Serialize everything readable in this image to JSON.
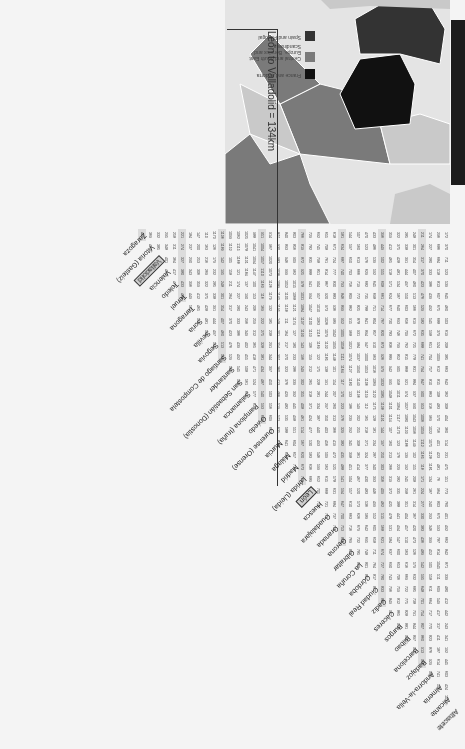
{
  "page": {
    "orientation": "rotated 180 degrees",
    "title": "León to Valladolid = 134km"
  },
  "map": {
    "legend": [
      {
        "label": "France and Andorra",
        "color": "#111111"
      },
      {
        "label": "Central and South East Europe, Benelux and Scandinavia",
        "color": "#7a7a7a"
      },
      {
        "label": "Spain and Portugal",
        "color": "#333333"
      }
    ],
    "colors": {
      "sea": "#e8e8e8",
      "other_land": "#c9c9c9",
      "border": "#ffffff"
    }
  },
  "table": {
    "cities": [
      "Albacete",
      "Alicante",
      "Almeria",
      "Andorra-la-Vella",
      "Badajoz",
      "Barcelona",
      "Bilbao",
      "Burgos",
      "Cáceres",
      "Cadiz",
      "Ciudad Real",
      "Córdoba",
      "La Coruña",
      "Gibraltar",
      "Gerona",
      "Granada",
      "Guadalajara",
      "Huesca",
      "León",
      "Lérida (Lleida)",
      "Madrid",
      "Málaga",
      "Murcia",
      "Ourense (Orense)",
      "Oviedo",
      "Pamplona (Iruña)",
      "Salamanca",
      "San Sebastián (Donostia)",
      "Santander",
      "Santiago de Compostela",
      "Segovia",
      "Sevilla",
      "Soria",
      "Tarragona",
      "Teruel",
      "Toledo",
      "Valencia",
      "Valladolid",
      "Vitoria (Gasteiz)",
      "Zaragoza"
    ],
    "highlighted": [
      "León",
      "Valladolid"
    ],
    "highlight_value": "134",
    "albacete_column": [
      "172",
      "370",
      "711",
      "523",
      "539",
      "645",
      "460",
      "503",
      "619",
      "208",
      "385",
      "663",
      "642",
      "362",
      "308",
      "404",
      "360",
      "514",
      "231",
      "475",
      "151",
      "773",
      "760",
      "401",
      "492",
      "662",
      "842",
      "871",
      "339",
      "480",
      "412",
      "442",
      "243",
      "341",
      "192",
      "445",
      "603",
      "424"
    ],
    "alicante_column": [
      "296",
      "686",
      "684",
      "518",
      "813",
      "607",
      "675",
      "688",
      "379",
      "524",
      "1009",
      "612",
      "815",
      "108",
      "483",
      "570",
      "756",
      "401",
      "423",
      "481",
      "76",
      "964",
      "803",
      "675",
      "593",
      "787",
      "814",
      "1045",
      "511",
      "609",
      "549",
      "417",
      "317",
      "411",
      "187",
      "614",
      "741",
      "506"
    ],
    "zaragoza_column": [
      "261",
      "328",
      "369",
      "375",
      "335",
      "380",
      "221",
      "190",
      "157",
      "229",
      "180",
      "307",
      "328",
      "380",
      "261"
    ],
    "vitoria_column": [
      "228",
      "359",
      "575",
      "422",
      "421",
      "489",
      "191",
      "625",
      "311",
      "662",
      "174"
    ],
    "valladolid_column": [
      "544",
      "257",
      "441",
      "598",
      "211",
      "589",
      "112",
      "488",
      "349"
    ],
    "highlight_columns_every": 5
  },
  "side_bar": {
    "color": "#1c1c1c"
  }
}
